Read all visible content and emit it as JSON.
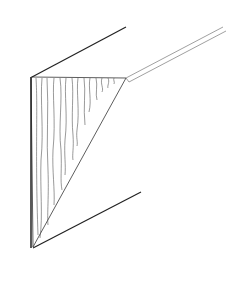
{
  "diagram": {
    "subject": "corner-molding-profile",
    "stroke_color": "#222222",
    "grain_color": "#555555",
    "background": "#ffffff",
    "outline": {
      "top_edge": [
        [
          32,
          77
        ],
        [
          126,
          27
        ]
      ],
      "left_edge": [
        [
          31,
          77
        ],
        [
          31,
          248
        ]
      ],
      "bottom_edge": [
        [
          33,
          248
        ],
        [
          141,
          192
        ]
      ]
    },
    "end_grain_face": [
      [
        31,
        77
      ],
      [
        126,
        78
      ],
      [
        33,
        247
      ]
    ],
    "strip": {
      "outer": [
        [
          126,
          78
        ],
        [
          223,
          27
        ]
      ],
      "inner": [
        [
          129,
          81
        ],
        [
          226,
          30
        ]
      ]
    }
  }
}
